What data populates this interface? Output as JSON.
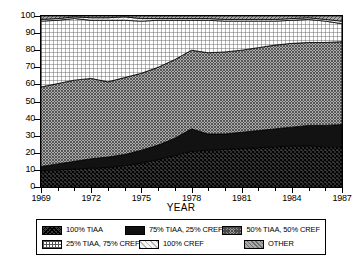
{
  "chart_data": {
    "type": "area",
    "title": "",
    "subtitle": "",
    "xlabel": "YEAR",
    "ylabel": "",
    "xlim": [
      1969,
      1987
    ],
    "ylim": [
      0,
      100
    ],
    "grid": false,
    "stacked": true,
    "legend_position": "bottom",
    "x": [
      1969,
      1970,
      1971,
      1972,
      1973,
      1974,
      1975,
      1976,
      1977,
      1978,
      1979,
      1980,
      1981,
      1982,
      1983,
      1984,
      1985,
      1986,
      1987
    ],
    "x_tick_labels": [
      "1969",
      "1972",
      "1975",
      "1978",
      "1981",
      "1984",
      "1987"
    ],
    "x_tick_values": [
      1969,
      1972,
      1975,
      1978,
      1981,
      1984,
      1987
    ],
    "y_tick_labels": [
      "0",
      "10",
      "20",
      "30",
      "40",
      "50",
      "60",
      "70",
      "80",
      "90",
      "100"
    ],
    "y_tick_values": [
      0,
      10,
      20,
      30,
      40,
      50,
      60,
      70,
      80,
      90,
      100
    ],
    "series": [
      {
        "name": "100% TIAA",
        "pattern": "dark-crosshatch",
        "color": "#3a3a3a",
        "values": [
          9.5,
          10.0,
          10.5,
          11.0,
          11.5,
          12.5,
          14.0,
          16.0,
          18.5,
          21.0,
          21.5,
          22.0,
          22.5,
          23.0,
          23.5,
          24.0,
          24.0,
          23.5,
          23.5
        ]
      },
      {
        "name": "75% TIAA, 25% CREF",
        "pattern": "solid-black",
        "color": "#101010",
        "values": [
          2.5,
          3.5,
          4.5,
          5.5,
          6.0,
          6.5,
          7.5,
          8.5,
          10.0,
          13.0,
          9.5,
          9.0,
          9.5,
          10.0,
          10.5,
          11.0,
          12.0,
          12.5,
          13.0
        ]
      },
      {
        "name": "50% TIAA, 50% CREF",
        "pattern": "mid-gray-check",
        "color": "#9a9a9a",
        "values": [
          46.5,
          47.0,
          47.5,
          47.0,
          44.0,
          45.0,
          45.0,
          45.5,
          46.0,
          46.0,
          47.5,
          48.0,
          48.0,
          48.5,
          49.0,
          49.0,
          48.5,
          48.5,
          48.5
        ]
      },
      {
        "name": "25% TIAA, 75% CREF",
        "pattern": "light-grid",
        "color": "#ffffff",
        "values": [
          38.5,
          37.0,
          36.0,
          34.0,
          36.0,
          33.5,
          30.5,
          27.5,
          23.0,
          17.5,
          19.0,
          18.0,
          17.0,
          15.5,
          14.0,
          13.5,
          13.5,
          12.5,
          10.5
        ]
      },
      {
        "name": "100% CREF",
        "pattern": "very-light-diagonal",
        "color": "#f2f2f2",
        "values": [
          1.0,
          1.0,
          1.0,
          1.5,
          1.5,
          2.0,
          1.5,
          1.0,
          1.0,
          1.0,
          1.0,
          1.0,
          1.0,
          1.0,
          1.0,
          1.0,
          1.0,
          1.0,
          1.5
        ]
      },
      {
        "name": "OTHER",
        "pattern": "gray-diagonal",
        "color": "#a8a8a8",
        "values": [
          2.0,
          1.5,
          0.5,
          1.0,
          1.0,
          0.5,
          1.5,
          1.5,
          1.5,
          1.5,
          1.5,
          2.0,
          2.0,
          2.0,
          2.0,
          1.5,
          1.0,
          2.0,
          3.0
        ]
      }
    ]
  },
  "legend": {
    "items": [
      {
        "label": "100% TIAA",
        "swatch": "sw-tiaa100"
      },
      {
        "label": "75% TIAA, 25% CREF",
        "swatch": "sw-tiaa75"
      },
      {
        "label": "50% TIAA, 50% CREF",
        "swatch": "sw-tiaa50"
      },
      {
        "label": "25% TIAA, 75% CREF",
        "swatch": "sw-tiaa25"
      },
      {
        "label": "100% CREF",
        "swatch": "sw-cref100"
      },
      {
        "label": "OTHER",
        "swatch": "sw-other"
      }
    ]
  }
}
